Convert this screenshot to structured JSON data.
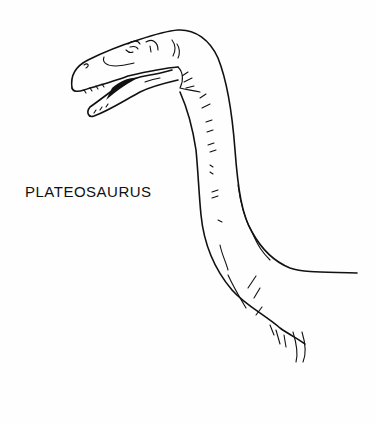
{
  "illustration": {
    "subject": "Plateosaurus head and neck line drawing",
    "caption": "PLATEOSAURUS",
    "colors": {
      "background": "#fefefe",
      "ink": "#111111"
    }
  }
}
